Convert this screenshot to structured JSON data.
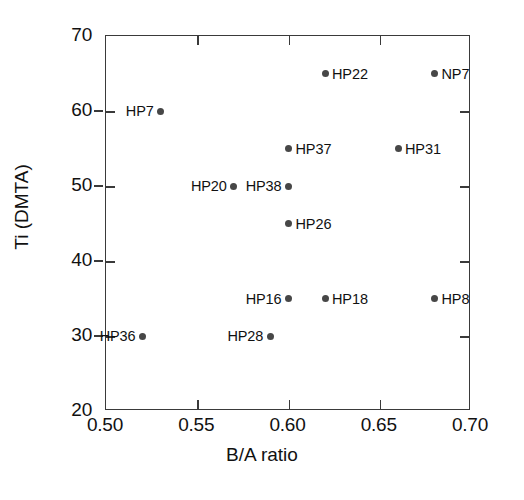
{
  "chart_data": {
    "type": "scatter",
    "title": "",
    "xlabel": "B/A ratio",
    "ylabel": "Ti (DMTA)",
    "xlim": [
      0.5,
      0.7
    ],
    "ylim": [
      20,
      70
    ],
    "xticks": [
      0.5,
      0.55,
      0.6,
      0.65,
      0.7
    ],
    "xtick_labels": [
      "0.50",
      "0.55",
      "0.60",
      "0.65",
      "0.70"
    ],
    "yticks": [
      20,
      30,
      40,
      50,
      60,
      70
    ],
    "ytick_labels": [
      "20",
      "30",
      "40",
      "50",
      "60",
      "70"
    ],
    "grid": false,
    "legend": "none",
    "marker_color": "#474747",
    "axis_color": "#3a3a3a",
    "points": [
      {
        "label": "HP22",
        "x": 0.62,
        "y": 65,
        "label_side": "right"
      },
      {
        "label": "NP7",
        "x": 0.68,
        "y": 65,
        "label_side": "right"
      },
      {
        "label": "HP7",
        "x": 0.53,
        "y": 60,
        "label_side": "left"
      },
      {
        "label": "HP37",
        "x": 0.6,
        "y": 55,
        "label_side": "right"
      },
      {
        "label": "HP31",
        "x": 0.66,
        "y": 55,
        "label_side": "right"
      },
      {
        "label": "HP20",
        "x": 0.57,
        "y": 50,
        "label_side": "left"
      },
      {
        "label": "HP38",
        "x": 0.6,
        "y": 50,
        "label_side": "left"
      },
      {
        "label": "HP26",
        "x": 0.6,
        "y": 45,
        "label_side": "right"
      },
      {
        "label": "HP16",
        "x": 0.6,
        "y": 35,
        "label_side": "left"
      },
      {
        "label": "HP18",
        "x": 0.62,
        "y": 35,
        "label_side": "right"
      },
      {
        "label": "HP8",
        "x": 0.68,
        "y": 35,
        "label_side": "right"
      },
      {
        "label": "HP36",
        "x": 0.52,
        "y": 30,
        "label_side": "left"
      },
      {
        "label": "HP28",
        "x": 0.59,
        "y": 30,
        "label_side": "left"
      }
    ]
  }
}
